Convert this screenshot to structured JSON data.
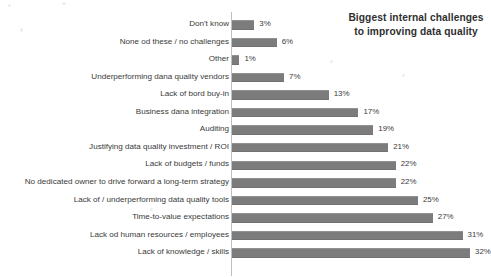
{
  "chart_data": {
    "type": "bar",
    "orientation": "horizontal",
    "title": "Biggest internal challenges to improving data quality",
    "title_lines": [
      "Biggest internal challenges",
      "to improving data quality"
    ],
    "xlabel": "",
    "ylabel": "",
    "xlim": [
      0,
      32
    ],
    "grid": false,
    "legend": false,
    "axis_line": true,
    "bar_color": "#7c7c7c",
    "text_color": "#3a3a3a",
    "background": "#ffffff",
    "value_suffix": "%",
    "categories": [
      "Don't know",
      "None od these / no challenges",
      "Other",
      "Underperforming dana quality vendors",
      "Lack of bord buy-in",
      "Business dana integration",
      "Auditing",
      "Justifying data quality investment / ROI",
      "Lack of budgets / funds",
      "No dedicated owner to drive forward a long-term strategy",
      "Lack of / underperforming data quality tools",
      "Time-to-value expectations",
      "Lack od human resources / employees",
      "Lack of knowledge / skills"
    ],
    "values": [
      3,
      6,
      1,
      7,
      13,
      17,
      19,
      21,
      22,
      22,
      25,
      27,
      31,
      32
    ],
    "value_labels": [
      "3%",
      "6%",
      "1%",
      "7%",
      "13%",
      "17%",
      "19%",
      "21%",
      "22%",
      "22%",
      "25%",
      "27%",
      "31%",
      "32%"
    ]
  }
}
